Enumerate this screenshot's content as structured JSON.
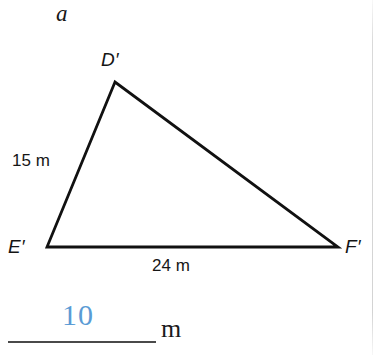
{
  "figure": {
    "part_label": "a",
    "background_color": "#ffffff",
    "stroke_color": "#111111",
    "accent_color": "#5a9bd5",
    "vertices": {
      "d_prime": {
        "label": "D′",
        "x": 115,
        "y": 82
      },
      "e_prime": {
        "label": "E′",
        "x": 47,
        "y": 247
      },
      "f_prime": {
        "label": "F′",
        "x": 338,
        "y": 247
      }
    },
    "side_labels": [
      {
        "name": "side-de",
        "text": "15 m",
        "value": 15,
        "unit": "m"
      },
      {
        "name": "side-ef",
        "text": "24 m",
        "value": 24,
        "unit": "m"
      }
    ]
  },
  "answer": {
    "value": "10",
    "unit": "m",
    "is_filled": true
  }
}
